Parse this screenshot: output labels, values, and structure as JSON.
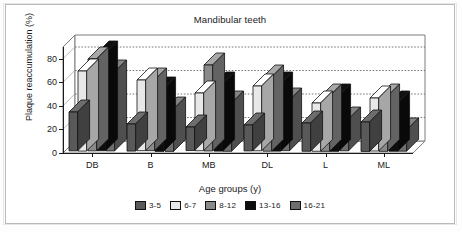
{
  "chart_data": {
    "type": "bar",
    "title": "Mandibular teeth",
    "xlabel": "Age groups (y)",
    "ylabel": "Plaque reaccumulation (%)",
    "categories": [
      "DB",
      "B",
      "MB",
      "DL",
      "L",
      "ML"
    ],
    "ylim": [
      0,
      90
    ],
    "yticks": [
      0,
      20,
      40,
      60,
      80
    ],
    "ytick_labels": [
      "0",
      "20",
      "40",
      "60",
      "80"
    ],
    "grid": "horizontal-dotted",
    "legend_position": "bottom",
    "style": "3d-column",
    "series": [
      {
        "name": "3-5",
        "color": "#595959",
        "values": [
          33,
          23,
          20,
          22,
          24,
          25
        ]
      },
      {
        "name": "6-7",
        "color": "#e8e8e8",
        "values": [
          68,
          60,
          49,
          55,
          41,
          45
        ]
      },
      {
        "name": "8-12",
        "color": "#8a8a8a",
        "values": [
          78,
          60,
          73,
          63,
          47,
          47
        ]
      },
      {
        "name": "13-16",
        "color": "#0d0d0d",
        "values": [
          83,
          53,
          57,
          57,
          47,
          41
        ]
      },
      {
        "name": "16-21",
        "color": "#6e6e6e",
        "values": [
          67,
          36,
          41,
          43,
          27,
          18
        ]
      }
    ]
  }
}
